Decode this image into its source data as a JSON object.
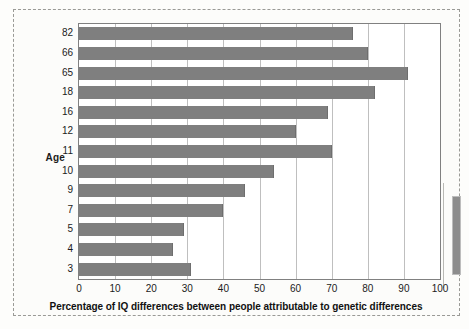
{
  "chart_data": {
    "type": "bar",
    "orientation": "horizontal",
    "title": "",
    "xlabel": "Percentage of IQ differences between people attributable to genetic differences",
    "ylabel": "Age",
    "categories": [
      "82",
      "66",
      "65",
      "18",
      "16",
      "12",
      "11",
      "10",
      "9",
      "7",
      "5",
      "4",
      "3"
    ],
    "values": [
      76,
      80,
      91,
      82,
      69,
      60,
      70,
      54,
      46,
      40,
      29,
      26,
      31
    ],
    "xlim": [
      0,
      100
    ],
    "xticks": [
      "0",
      "10",
      "20",
      "30",
      "40",
      "50",
      "60",
      "70",
      "80",
      "90",
      "100"
    ],
    "xtick_values": [
      0,
      10,
      20,
      30,
      40,
      50,
      60,
      70,
      80,
      90,
      100
    ],
    "grid": "vertical",
    "legend": "none",
    "bar_color": "#7f7f7f",
    "plot_border_color": "#808080",
    "gridline_color": "#bfbfbf",
    "background_color": "#ffffff"
  },
  "figure": {
    "frame_style": "dashed",
    "frame_color": "#9a9a96",
    "page_background": "#fdfdfb",
    "side_swatch_color": "#8d8d8d"
  }
}
